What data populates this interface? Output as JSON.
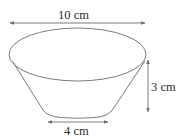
{
  "figure": {
    "shape": "frustum-bowl",
    "labels": {
      "top_diameter": "10 cm",
      "height": "3 cm",
      "bottom_diameter": "4 cm"
    },
    "colors": {
      "stroke": "#7a7a7a",
      "arrow": "#6e6e6e",
      "text": "#2a2a2a",
      "background": "#ffffff"
    }
  }
}
